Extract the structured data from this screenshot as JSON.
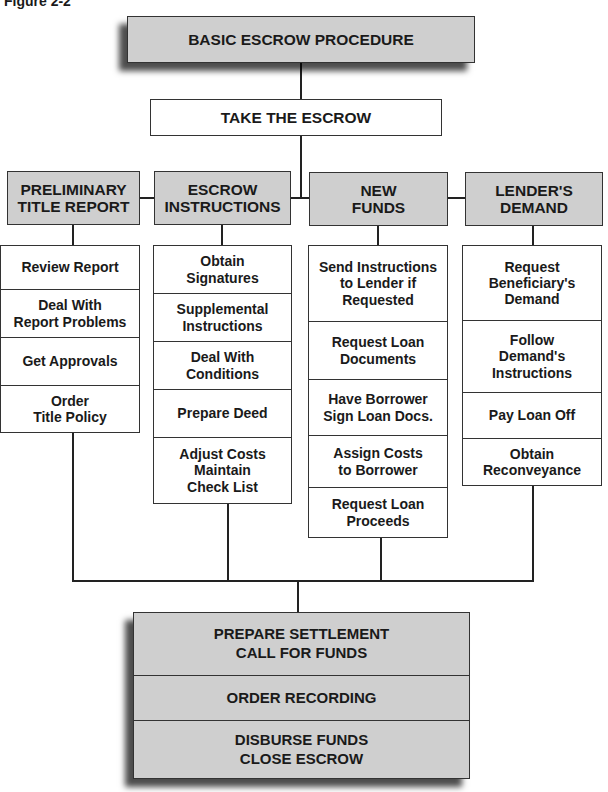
{
  "figure_label": "Figure 2-2",
  "title": "BASIC ESCROW PROCEDURE",
  "step": "TAKE THE ESCROW",
  "columns": [
    {
      "header": "PRELIMINARY\nTITLE REPORT",
      "items": [
        "Review Report",
        "Deal With\nReport Problems",
        "Get Approvals",
        "Order\nTitle Policy"
      ]
    },
    {
      "header": "ESCROW\nINSTRUCTIONS",
      "items": [
        "Obtain\nSignatures",
        "Supplemental\nInstructions",
        "Deal With\nConditions",
        "Prepare Deed",
        "Adjust Costs\nMaintain\nCheck List"
      ]
    },
    {
      "header": "NEW\nFUNDS",
      "items": [
        "Send Instructions\nto Lender if\nRequested",
        "Request Loan\nDocuments",
        "Have Borrower\nSign Loan Docs.",
        "Assign Costs\nto Borrower",
        "Request Loan\nProceeds"
      ]
    },
    {
      "header": "LENDER'S\nDEMAND",
      "items": [
        "Request\nBeneficiary's\nDemand",
        "Follow\nDemand's\nInstructions",
        "Pay Loan Off",
        "Obtain\nReconveyance"
      ]
    }
  ],
  "closing": [
    "PREPARE SETTLEMENT\nCALL FOR FUNDS",
    "ORDER RECORDING",
    "DISBURSE FUNDS\nCLOSE ESCROW"
  ]
}
